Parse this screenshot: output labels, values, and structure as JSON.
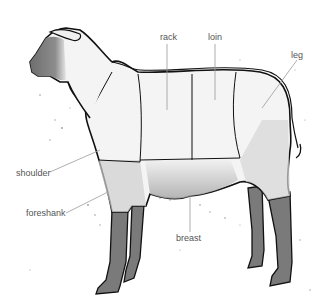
{
  "diagram": {
    "labels": {
      "rack": "rack",
      "loin": "loin",
      "leg": "leg",
      "shoulder": "shoulder",
      "foreshank": "foreshank",
      "breast": "breast"
    },
    "colors": {
      "outline": "#111111",
      "leg_fill": "#7a7a7a",
      "head_fill": "#8a8a8a",
      "body_fill": "#f2f2f2",
      "shade": "#bdbdbd",
      "leader": "#9a9a9a",
      "label_text": "#555555"
    }
  }
}
